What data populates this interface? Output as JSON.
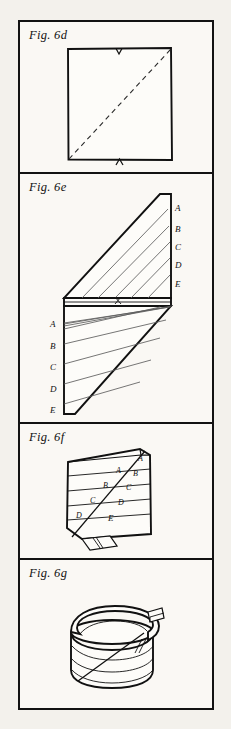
{
  "plate": {
    "background_color": "#f3f1ec",
    "paper_color": "#faf8f4",
    "ink_color": "#111111",
    "panels": [
      {
        "id": "6d",
        "label": "Fig. 6d",
        "caption_style": "italic-serif",
        "figure_type": "square-with-diagonal-fold-line",
        "marks": {
          "top_edge_notch": "V",
          "bottom_edge_notch": "A"
        },
        "diagonal": "dashed, bottom-left to top-right"
      },
      {
        "id": "6e",
        "label": "Fig. 6e",
        "figure_type": "sheared-parallelogram-band-with-ruled-lines",
        "right_labels": [
          "A",
          "B",
          "C",
          "D",
          "E"
        ],
        "left_labels": [
          "A",
          "B",
          "C",
          "D",
          "E"
        ],
        "center_mark": "X"
      },
      {
        "id": "6f",
        "label": "Fig. 6f",
        "figure_type": "coiled-banded-block-with-diagonal",
        "left_of_diagonal_labels": [
          "A",
          "B",
          "C",
          "D"
        ],
        "right_of_diagonal_labels": [
          "A",
          "B",
          "C",
          "D",
          "E"
        ]
      },
      {
        "id": "6g",
        "label": "Fig. 6g",
        "figure_type": "helical-coil-cylinder-with-loose-end",
        "labels": []
      }
    ]
  }
}
